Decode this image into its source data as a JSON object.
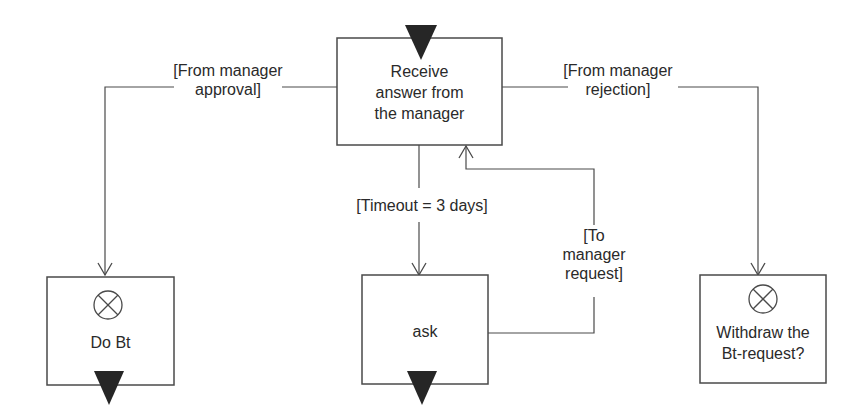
{
  "diagram": {
    "type": "activity-diagram",
    "colors": {
      "stroke": "#4a4a4a",
      "fill": "#ffffff",
      "marker": "#262626",
      "text": "#2a2a2a"
    },
    "nodes": [
      {
        "id": "receive",
        "label_lines": [
          "Receive",
          "answer from",
          "the manager"
        ],
        "start_marker": "filled-triangle-top"
      },
      {
        "id": "do_bt",
        "label": "Do Bt",
        "icon": "circle-x-icon",
        "end_marker": "filled-triangle-bottom"
      },
      {
        "id": "ask",
        "label": "ask",
        "end_marker": "filled-triangle-bottom"
      },
      {
        "id": "withdraw",
        "label_lines": [
          "Withdraw the",
          "Bt-request?"
        ],
        "icon": "circle-x-icon"
      }
    ],
    "edges": [
      {
        "from": "receive",
        "to": "do_bt",
        "guard_lines": [
          "[From manager",
          "approval]"
        ]
      },
      {
        "from": "receive",
        "to": "withdraw",
        "guard_lines": [
          "[From manager",
          "rejection]"
        ]
      },
      {
        "from": "receive",
        "to": "ask",
        "guard": "[Timeout = 3 days]"
      },
      {
        "from": "ask",
        "to": "receive",
        "guard_lines": [
          "[To",
          "manager",
          "request]"
        ]
      }
    ]
  }
}
